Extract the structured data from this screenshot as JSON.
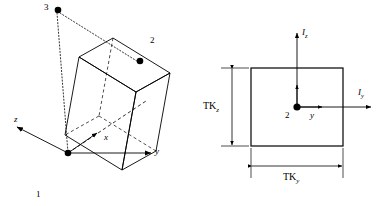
{
  "figure": {
    "caption": "",
    "stroke_color": "#000000",
    "background_color": "#ffffff"
  },
  "beam_view": {
    "name": "3D beam element view",
    "nodes": [
      {
        "id": "node-1",
        "label": "1",
        "role": "start node",
        "x": 38,
        "y": 196
      },
      {
        "id": "node-2",
        "label": "2",
        "role": "end node",
        "x": 152,
        "y": 43
      },
      {
        "id": "node-3",
        "label": "3",
        "role": "orientation node",
        "x": 49,
        "y": 8
      }
    ],
    "axes": [
      {
        "id": "axis-x",
        "label": "x",
        "direction": "along beam length"
      },
      {
        "id": "axis-y",
        "label": "y",
        "direction": "transverse horizontal"
      },
      {
        "id": "axis-z",
        "label": "z",
        "direction": "transverse out of plane"
      }
    ]
  },
  "section_view": {
    "name": "Cross-section view at node 2",
    "origin_label": "2",
    "axes": [
      {
        "id": "section-axis-y",
        "label": "y"
      }
    ],
    "inertia_arrows": [
      {
        "id": "inertia-z",
        "label": "I",
        "subscript": "z"
      },
      {
        "id": "inertia-y",
        "label": "I",
        "subscript": "y"
      }
    ],
    "dimensions": [
      {
        "id": "dim-tkz",
        "label": "TK",
        "subscript": "z",
        "orientation": "vertical"
      },
      {
        "id": "dim-tky",
        "label": "TK",
        "subscript": "y",
        "orientation": "horizontal"
      }
    ]
  }
}
